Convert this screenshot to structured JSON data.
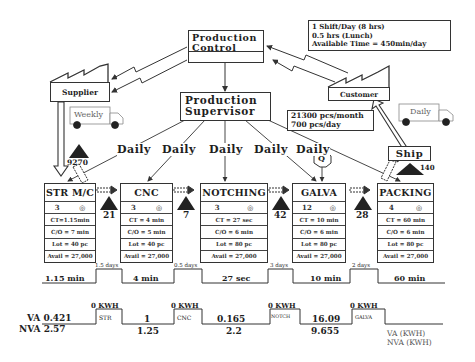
{
  "production_control": {
    "line1": "Production",
    "line2": "Control"
  },
  "shift_info": {
    "line1": "1 Shift/Day (8 hrs)",
    "line2": "0.5 hrs (Lunch)",
    "line3": "Available Time = 450min/day"
  },
  "supplier": {
    "label": "Supplier",
    "truck_label": "Weekly",
    "inventory": "9270"
  },
  "customer": {
    "label": "Customer",
    "truck_label": "Daily",
    "demand_line1": "21300 pcs/month",
    "demand_line2": "700 pcs/day"
  },
  "production_supervisor": {
    "line1": "Production",
    "line2": "Supervisor"
  },
  "schedule_labels": [
    "Daily",
    "Daily",
    "Daily",
    "Daily",
    "Daily"
  ],
  "ship": {
    "label": "Ship",
    "inventory": "140"
  },
  "quality_label": "Q",
  "processes": [
    {
      "name": "STR M/C",
      "operators": "3",
      "ct": "CT=1.15min",
      "co": "C/O = 7 min",
      "lot": "Lot = 40 pc",
      "avail": "Avail = 27,000"
    },
    {
      "name": "CNC",
      "operators": "3",
      "ct": "CT = 4 min",
      "co": "C/O = 5 min",
      "lot": "Lot = 40 pc",
      "avail": "Avail = 27,000"
    },
    {
      "name": "NOTCHING",
      "operators": "3",
      "ct": "CT = 27 sec",
      "co": "C/O = 6 min",
      "lot": "Lot = 80 pc",
      "avail": "Avail = 27,000"
    },
    {
      "name": "GALVA",
      "operators": "12",
      "ct": "CT = 10 min",
      "co": "C/O = 6 min",
      "lot": "Lot = 80 pc",
      "avail": "Avail = 27,000"
    },
    {
      "name": "PACKING",
      "operators": "4",
      "ct": "CT = 60 min",
      "co": "C/O = 6 min",
      "lot": "Lot = 80 pc",
      "avail": "Avail = 27,000"
    }
  ],
  "inventories": [
    "21",
    "7",
    "42",
    "28"
  ],
  "timeline": {
    "process_times": [
      "1.15 min",
      "4 min",
      "27 sec",
      "10 min",
      "60 min"
    ],
    "wait_times": [
      "1.5 days",
      "0.5 days",
      "3 days",
      "2 days"
    ]
  },
  "energy": {
    "va_label": "VA 0.421",
    "nva_label": "NVA 2.57",
    "va_values": [
      "1",
      "0.165",
      "16.09"
    ],
    "nva_values": [
      "1.25",
      "2.2",
      "9.655"
    ],
    "kwh_labels": [
      "0 KWH",
      "0 KWH",
      "0 KWH",
      "0 KWH"
    ],
    "step_labels": [
      "STR",
      "CNC",
      "NOTCH",
      "GALVA"
    ],
    "legend_va": "VA (KWH)",
    "legend_nva": "NVA (KWH)"
  }
}
